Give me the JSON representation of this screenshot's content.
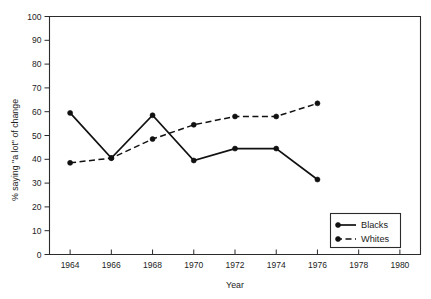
{
  "chart_data": {
    "type": "line",
    "title": "",
    "xlabel": "Year",
    "ylabel": "% saying \"a lot\" of change",
    "x": [
      1964,
      1966,
      1968,
      1970,
      1972,
      1974,
      1976
    ],
    "xlim": [
      1963,
      1981
    ],
    "ylim": [
      0,
      100
    ],
    "grid": false,
    "legend_position": "bottom-right",
    "xticks": [
      "1964",
      "1966",
      "1968",
      "1970",
      "1972",
      "1974",
      "1976",
      "1978",
      "1980"
    ],
    "xtick_values": [
      1964,
      1966,
      1968,
      1970,
      1972,
      1974,
      1976,
      1978,
      1980
    ],
    "yticks": [
      "0",
      "10",
      "20",
      "30",
      "40",
      "50",
      "60",
      "70",
      "80",
      "90",
      "100"
    ],
    "ytick_values": [
      0,
      10,
      20,
      30,
      40,
      50,
      60,
      70,
      80,
      90,
      100
    ],
    "series": [
      {
        "name": "Blacks",
        "style": "solid",
        "marker": "filled-circle",
        "values": [
          59.5,
          40.5,
          58.5,
          39.5,
          44.5,
          44.5,
          31.5
        ]
      },
      {
        "name": "Whites",
        "style": "dashed",
        "marker": "filled-circle",
        "values": [
          38.5,
          40.5,
          48.5,
          54.5,
          58.0,
          58.0,
          63.5
        ]
      }
    ]
  },
  "legend": {
    "entries": [
      {
        "label": "Blacks"
      },
      {
        "label": "Whites"
      }
    ]
  },
  "axes": {
    "x_title": "Year",
    "y_title": "% saying \"a lot\" of change"
  },
  "colors": {
    "ink": "#111111",
    "frame": "#2b2b2b",
    "background": "#ffffff"
  }
}
